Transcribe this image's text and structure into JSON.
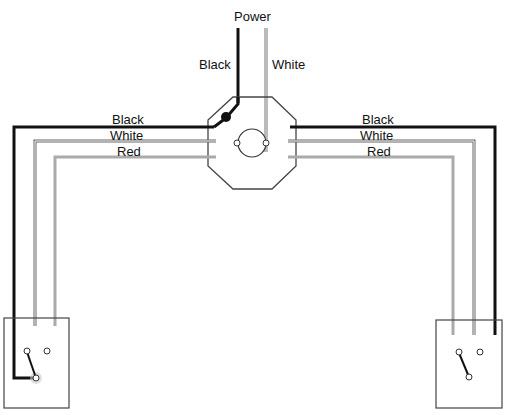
{
  "diagram": {
    "type": "three-way switch wiring",
    "power_label": "Power",
    "feed_labels": {
      "black": "Black",
      "white": "White"
    },
    "left_run_labels": [
      "Black",
      "White",
      "Red"
    ],
    "right_run_labels": [
      "Black",
      "White",
      "Red"
    ],
    "components": [
      "junction box",
      "light fixture",
      "left three-way switch",
      "right three-way switch"
    ],
    "colors": {
      "black_wire": "#111111",
      "white_wire": "#666666",
      "red_wire": "#aaaaaa",
      "outline": "#444444"
    }
  }
}
